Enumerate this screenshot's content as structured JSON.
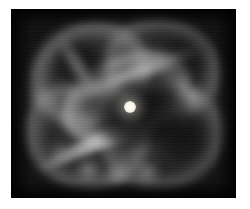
{
  "page": {
    "background_color": "#ffffff",
    "width": 250,
    "height": 209
  },
  "figure": {
    "name": "planetary-nebula-image",
    "kind": "astronomical-image",
    "color_mode": "grayscale",
    "caption": "",
    "plate": {
      "x": 11,
      "y": 9,
      "width": 225,
      "height": 189,
      "background_color": "#050505",
      "border_color": "#050505"
    }
  },
  "objects": {
    "central_star": {
      "label": "central-star",
      "x": 130,
      "y": 107,
      "core_radius_px": 6,
      "glow_radius_px": 18,
      "core_color": "#ffffff",
      "glow_color": "#fffdf2"
    },
    "inner_shell": {
      "label": "inner-elliptical-shell",
      "center_x": 126,
      "center_y": 98,
      "semi_major_px": 67,
      "semi_minor_px": 41,
      "position_angle_deg": -24,
      "rim_color": "#babab a"
    },
    "cavity": {
      "label": "inner-dark-cavity",
      "center_x": 141,
      "center_y": 114,
      "width_px": 92,
      "height_px": 62,
      "color": "#050505"
    },
    "lobes": [
      {
        "label": "outer-lobe-upper-left",
        "center_x": 91,
        "center_y": 75,
        "rotation_deg": -18,
        "peak_gray": "#a8a8a8"
      },
      {
        "label": "outer-lobe-upper-right",
        "center_x": 162,
        "center_y": 69,
        "rotation_deg": 14,
        "peak_gray": "#a0a0a0"
      },
      {
        "label": "outer-lobe-lower-left",
        "center_x": 87,
        "center_y": 135,
        "rotation_deg": 12,
        "peak_gray": "#a4a4a4"
      },
      {
        "label": "outer-lobe-lower-right",
        "center_x": 163,
        "center_y": 137,
        "rotation_deg": -14,
        "peak_gray": "#9c9c9c"
      }
    ],
    "filaments": [
      {
        "label": "bright-diagonal-ridge",
        "from_x": 27,
        "from_y": 170,
        "to_x": 199,
        "to_y": 95,
        "rotation_deg": -25,
        "peak_gray": "#dadada"
      },
      {
        "label": "upper-cross-filament",
        "from_x": 59,
        "from_y": 110,
        "to_x": 209,
        "to_y": 55,
        "rotation_deg": -20,
        "peak_gray": "#c8c8c8"
      },
      {
        "label": "upper-left-rim-arc",
        "from_x": 41,
        "from_y": 61,
        "to_x": 115,
        "to_y": 73,
        "rotation_deg": 58,
        "peak_gray": "#b0b0b0"
      }
    ],
    "knots": [
      {
        "label": "knot-right-rim",
        "x": 192,
        "y": 97,
        "peak_gray": "#cdcdcd"
      },
      {
        "label": "knot-left-rim",
        "x": 41,
        "y": 98,
        "peak_gray": "#aaaaaa"
      },
      {
        "label": "knot-bottom-1",
        "x": 88,
        "y": 170,
        "peak_gray": "#bebebe"
      },
      {
        "label": "knot-bottom-2",
        "x": 117,
        "y": 175,
        "peak_gray": "#afafaf"
      },
      {
        "label": "knot-bottom-3",
        "x": 147,
        "y": 172,
        "peak_gray": "#b9b9b9"
      },
      {
        "label": "knot-lower-left",
        "x": 60,
        "y": 152,
        "peak_gray": "#aaaaaa"
      }
    ],
    "dark_cells": [
      {
        "label": "dark-cell-upper-left",
        "x": 81,
        "y": 66,
        "color": "#060606"
      },
      {
        "label": "dark-cell-upper-right",
        "x": 184,
        "y": 59,
        "color": "#060606"
      },
      {
        "label": "dark-cell-lower-right",
        "x": 179,
        "y": 135,
        "color": "#050505"
      }
    ]
  }
}
